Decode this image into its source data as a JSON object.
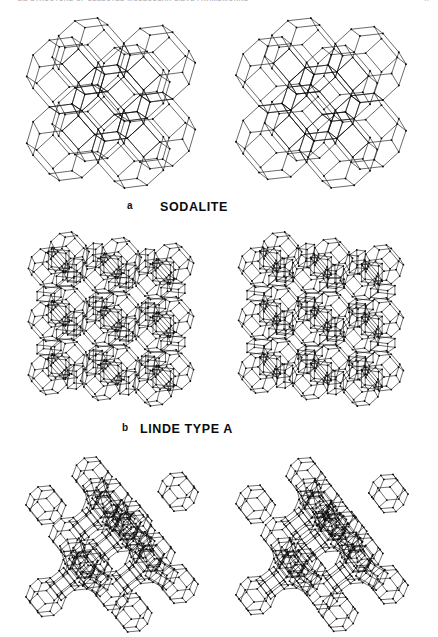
{
  "page": {
    "width": 438,
    "height": 611,
    "background": "#ffffff",
    "ink_color": "#0d0d0d"
  },
  "running_head": {
    "text": "2.2   STRUCTURE OF SELECTED MOLECULAR SIEVE FRAMEWORKS",
    "page_number": "47",
    "color": "#b9b9bd",
    "visible": "cropped"
  },
  "figure": {
    "type": "stereo-pair-wireframe",
    "panels": [
      {
        "letter": "a",
        "title": "SODALITE",
        "structure": "sodalite",
        "cage": "truncated-octahedron",
        "arrangement": "2x2 body-centred array of beta cages sharing 4-rings",
        "caption_letter_x": 127,
        "caption_title_x": 160,
        "caption_y": 200,
        "block_top": 14,
        "block_height": 180,
        "left_pane_x": 22,
        "right_pane_x": 232,
        "pane_width": 178,
        "pane_height": 178,
        "stereo_tilt_deg": 3.0,
        "cage_rows": 2,
        "cage_cols": 2,
        "cage_radius": 44,
        "link_style": "4-ring",
        "line_width": 0.62,
        "node_radius": 0.95
      },
      {
        "letter": "b",
        "title": "LINDE TYPE A",
        "structure": "linde-type-a",
        "cage": "alpha-cavity-with-sodalite-and-d4r",
        "arrangement": "sodalite cages joined through double-4-rings enclosing alpha cages",
        "caption_letter_x": 122,
        "caption_title_x": 140,
        "caption_y": 422,
        "block_top": 228,
        "block_height": 185,
        "left_pane_x": 20,
        "right_pane_x": 230,
        "pane_width": 182,
        "pane_height": 182,
        "stereo_tilt_deg": 3.0,
        "cage_rows": 2,
        "cage_cols": 2,
        "cage_radius": 40,
        "link_style": "double-4-ring",
        "line_width": 0.6,
        "node_radius": 0.9
      },
      {
        "letter": "c",
        "title": "",
        "structure": "faujasite",
        "cage": "sodalite-cages-joined-by-hexagonal-prisms",
        "arrangement": "tetrahedral array of beta cages linked by double-6-rings around a supercage",
        "caption_letter_x": 0,
        "caption_title_x": 0,
        "caption_y": 0,
        "block_top": 452,
        "block_height": 159,
        "left_pane_x": 22,
        "right_pane_x": 232,
        "pane_width": 180,
        "pane_height": 185,
        "stereo_tilt_deg": 3.0,
        "cage_rows": 2,
        "cage_cols": 2,
        "cage_radius": 40,
        "link_style": "double-6-ring",
        "line_width": 0.6,
        "node_radius": 0.9,
        "cropped_at_bottom": true
      }
    ]
  }
}
